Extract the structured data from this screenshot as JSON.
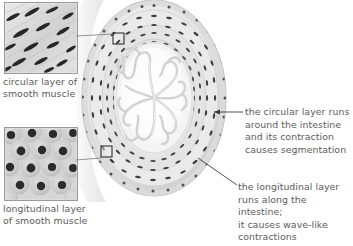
{
  "figure": {
    "type": "anatomical-illustration",
    "palette": {
      "background": "#ffffff",
      "text": "#5b5b5b",
      "leader_line": "#4a4a4a",
      "tissue_light": "#f2f2f2",
      "tissue_mid": "#d4d4d4",
      "tissue_dark": "#8f8f8f",
      "nuclei": "#3c3c3c",
      "inset_border": "#9a9a9a"
    }
  },
  "insets": [
    {
      "id": "circular",
      "caption": "circular layer of\nsmooth muscle",
      "texture": "diagonal elongated spindle-shaped smooth muscle cells in longitudinal section"
    },
    {
      "id": "longitudinal",
      "caption": "longitudinal layer\nof smooth muscle",
      "texture": "round smooth muscle cells in cross-section with dark central nuclei"
    }
  ],
  "annotations": [
    {
      "id": "circular-layer",
      "text": "the circular layer runs\naround the intestine\nand its contraction\ncauses segmentation"
    },
    {
      "id": "longitudinal-layer",
      "text": "the longitudinal layer\nruns along the intestine;\nit causes wave-like\ncontractions"
    }
  ],
  "markers": [
    {
      "id": "circular-marker",
      "label": "magnified region of circular layer"
    },
    {
      "id": "longitudinal-marker",
      "label": "magnified region of longitudinal layer"
    }
  ]
}
